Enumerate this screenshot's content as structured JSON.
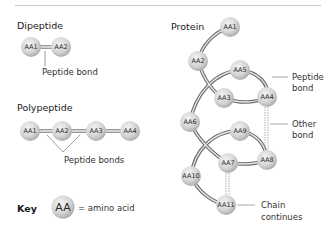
{
  "dipeptide": {
    "title": "Dipeptide",
    "nodes": [
      "AA1",
      "AA2"
    ],
    "bond_label": "Peptide bond"
  },
  "polypeptide": {
    "title": "Polypeptide",
    "nodes": [
      "AA1",
      "AA2",
      "AA3",
      "AA4"
    ],
    "bond_label": "Peptide bonds"
  },
  "key": {
    "label": "Key",
    "symbol": "AA",
    "meaning": "= amino acid"
  },
  "protein": {
    "title": "Protein",
    "nodes": [
      "AA1",
      "AA2",
      "AA3",
      "AA4",
      "AA5",
      "AA6",
      "AA7",
      "AA8",
      "AA9",
      "AA10",
      "AA11"
    ],
    "callouts": {
      "peptide_bond": [
        "Peptide",
        "bond"
      ],
      "other_bond": [
        "Other",
        "bond"
      ],
      "chain_continues": [
        "Chain",
        "continues"
      ]
    }
  },
  "colors": {
    "sphere_light": "#f2f2f2",
    "sphere_dark": "#a8a8a8",
    "bond": "#6e6e6e",
    "rule": "#c8c8c8"
  }
}
